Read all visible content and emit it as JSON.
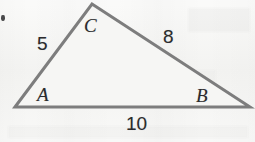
{
  "figure": {
    "type": "triangle-diagram",
    "background_color": "#f5f5f3",
    "stroke_color": "#7d7d7d",
    "label_color": "#2b2b2d",
    "vertices": [
      {
        "id": "A",
        "label": "A",
        "x": 15,
        "y": 107
      },
      {
        "id": "B",
        "label": "B",
        "x": 250,
        "y": 107
      },
      {
        "id": "C",
        "label": "C",
        "x": 92,
        "y": 4
      }
    ],
    "sides": [
      {
        "id": "AC",
        "label": "5",
        "from": "A",
        "to": "C",
        "position": "left"
      },
      {
        "id": "CB",
        "label": "8",
        "from": "C",
        "to": "B",
        "position": "right"
      },
      {
        "id": "AB",
        "label": "10",
        "from": "A",
        "to": "B",
        "position": "bottom"
      }
    ]
  },
  "chart_data": {
    "type": "diagram",
    "title": "",
    "shape": "triangle",
    "vertex_labels": [
      "A",
      "B",
      "C"
    ],
    "side_labels": [
      "5",
      "8",
      "10"
    ],
    "side_lengths": {
      "AC": 5,
      "CB": 8,
      "AB": 10
    },
    "points": {
      "A": [
        15,
        107
      ],
      "B": [
        250,
        107
      ],
      "C": [
        92,
        4
      ]
    },
    "xlabel": "",
    "ylabel": "",
    "grid": false,
    "legend": "none"
  }
}
